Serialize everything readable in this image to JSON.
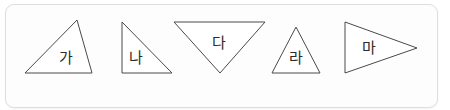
{
  "panel": {
    "name": "figure-panel",
    "background_color": "#fdfdfd",
    "border_color": "#dedede",
    "corner_radius": "9px"
  },
  "style": {
    "outline_color": "#4a4a4a",
    "fill_color": "#ffffff",
    "label_color": "#2b2b2b",
    "stroke_width": 1
  },
  "figures": [
    {
      "id": "figure-ga",
      "label": "가",
      "shape": "triangle",
      "orientation": "scalene-apex-right-of-center",
      "points": "77,20 92,73 25,73",
      "label_x": 66,
      "label_y": 58
    },
    {
      "id": "figure-na",
      "label": "나",
      "shape": "triangle",
      "orientation": "right-angle-bottom-left",
      "points": "122,22 172,73 122,73",
      "label_x": 136,
      "label_y": 58
    },
    {
      "id": "figure-da",
      "label": "다",
      "shape": "triangle",
      "orientation": "inverted-apex-down",
      "points": "174,22 265,22 220,73",
      "label_x": 219,
      "label_y": 43
    },
    {
      "id": "figure-ra",
      "label": "라",
      "shape": "triangle",
      "orientation": "isosceles-apex-up",
      "points": "296,27 320,73 272,73",
      "label_x": 296,
      "label_y": 58
    },
    {
      "id": "figure-ma",
      "label": "마",
      "shape": "triangle",
      "orientation": "apex-right",
      "points": "345,22 417,48 345,73",
      "label_x": 369,
      "label_y": 48
    }
  ]
}
